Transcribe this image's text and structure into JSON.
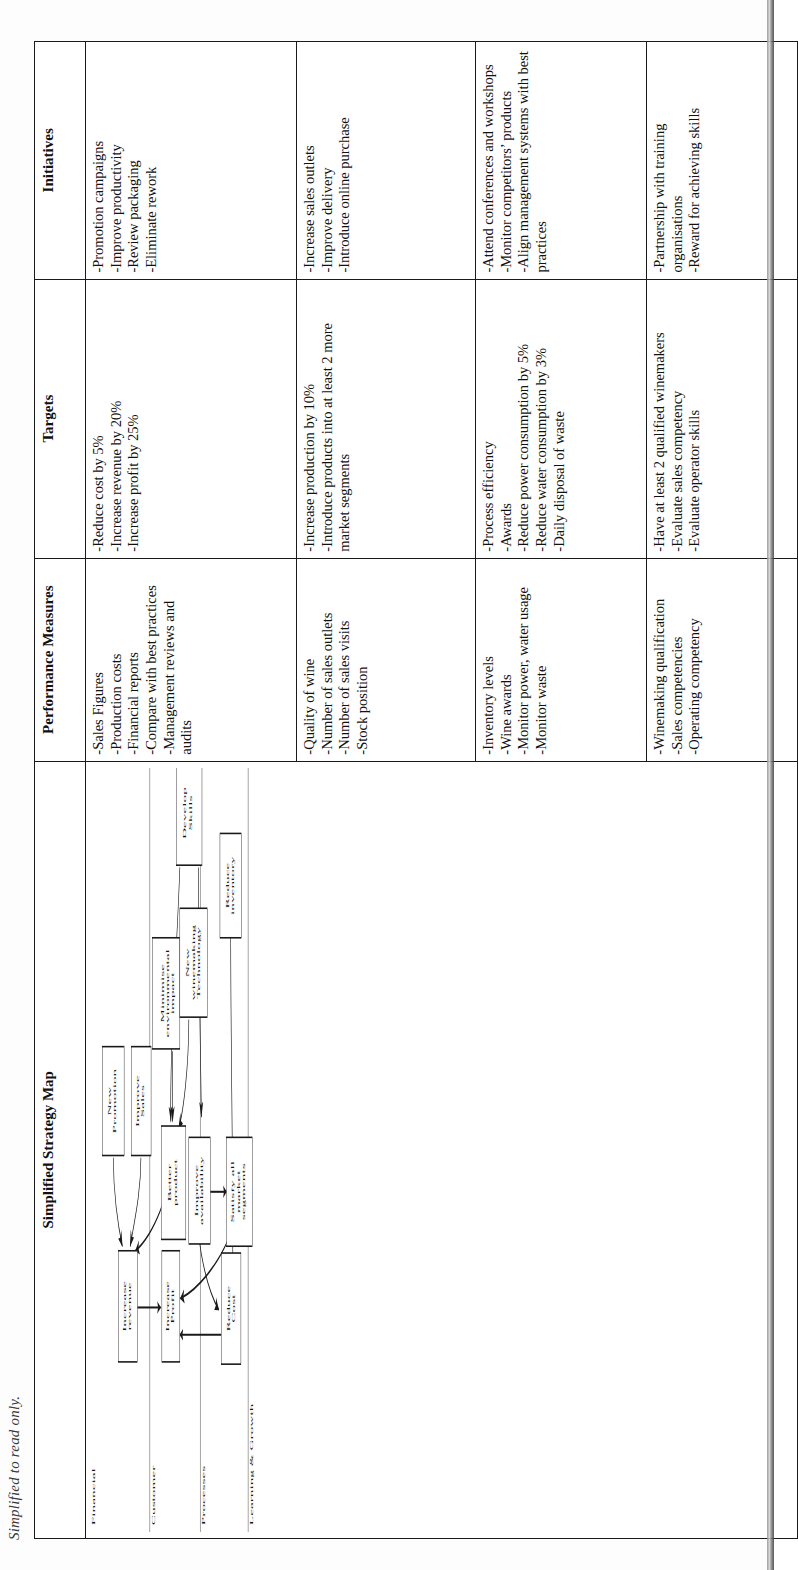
{
  "caption": "Simplified to read only.",
  "table": {
    "headers": [
      "Simplified Strategy Map",
      "Performance Measures",
      "Targets",
      "Initiatives"
    ],
    "rows": [
      {
        "perspective": "Financial",
        "performance_measures": "-Sales Figures\n-Production costs\n-Financial reports\n-Compare with best practices\n-Management reviews and audits",
        "targets": "-Reduce cost by 5%\n-Increase revenue by 20%\n-Increase profit by 25%",
        "initiatives": "-Promotion campaigns\n-Improve productivity\n-Review packaging\n-Eliminate rework"
      },
      {
        "perspective": "Customer",
        "performance_measures": "-Quality of wine\n-Number of sales outlets\n-Number of sales visits\n-Stock position",
        "targets": "-Increase production by 10%\n-Introduce products into at least 2 more market segments",
        "initiatives": "-Increase sales outlets\n-Improve delivery\n-Introduce online purchase"
      },
      {
        "perspective": "Processes",
        "performance_measures": "-Inventory levels\n-Wine awards\n-Monitor power, water usage\n-Monitor waste",
        "targets": "-Process efficiency\n-Awards\n-Reduce power consumption by 5%\n-Reduce water consumption by 3%\n-Daily disposal of waste",
        "initiatives": "-Attend conferences and workshops\n-Monitor competitors’ products\n-Align management systems with best practices"
      },
      {
        "perspective": "Learning & Growth",
        "performance_measures": "-Winemaking qualification\n-Sales competencies\n-Operating competency",
        "targets": "-Have at least 2 qualified winemakers\n-Evaluate sales competency\n-Evaluate operator skills",
        "initiatives": "-Partnership with training organisations\n-Reward for achieving skills"
      }
    ]
  },
  "strategy_map": {
    "lane_labels": [
      "Financial",
      "Customer",
      "Processes",
      "Learning & Growth"
    ],
    "nodes": [
      {
        "id": "increase_revenue",
        "label": "Increase\nrevenue"
      },
      {
        "id": "increase_profit",
        "label": "Increase\nProfit"
      },
      {
        "id": "reduce_cost",
        "label": "Reduce\nCost"
      },
      {
        "id": "new_promotion",
        "label": "New\nPromotion"
      },
      {
        "id": "improve_sales",
        "label": "Improve\nSales"
      },
      {
        "id": "better_product",
        "label": "Better\nproduct"
      },
      {
        "id": "improve_avail",
        "label": "Improve\navailability"
      },
      {
        "id": "satisfy_segments",
        "label": "Satisfy all\nmarket\nsegments"
      },
      {
        "id": "minimise_env",
        "label": "Minimise\nenvironmental\nimpact"
      },
      {
        "id": "new_tech",
        "label": "New\nwinemaking\nTechnology"
      },
      {
        "id": "reduce_inventory",
        "label": "Reduce\ninventory"
      },
      {
        "id": "develop_skills",
        "label": "Develop\nSkills"
      }
    ],
    "edges": [
      {
        "from": "new_promotion",
        "to": "increase_revenue"
      },
      {
        "from": "improve_sales",
        "to": "increase_revenue"
      },
      {
        "from": "better_product",
        "to": "increase_revenue"
      },
      {
        "from": "increase_revenue",
        "to": "increase_profit"
      },
      {
        "from": "reduce_cost",
        "to": "increase_profit"
      },
      {
        "from": "satisfy_segments",
        "to": "increase_profit"
      },
      {
        "from": "improve_avail",
        "to": "satisfy_segments"
      },
      {
        "from": "improve_avail",
        "to": "reduce_cost"
      },
      {
        "from": "reduce_inventory",
        "to": "reduce_cost"
      },
      {
        "from": "minimise_env",
        "to": "better_product"
      },
      {
        "from": "new_tech",
        "to": "better_product"
      },
      {
        "from": "develop_skills",
        "to": "better_product"
      },
      {
        "from": "develop_skills",
        "to": "improve_avail"
      }
    ]
  },
  "colors": {
    "ink": "#1a1a1a",
    "paper": "#ffffff"
  }
}
